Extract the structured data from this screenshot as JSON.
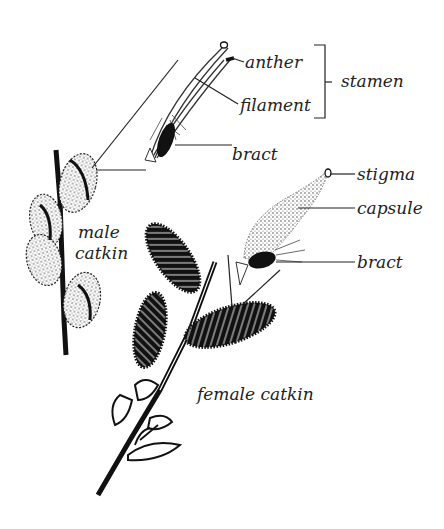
{
  "diagram": {
    "colors": {
      "ink": "#111111",
      "text": "#222222",
      "background": "#ffffff"
    },
    "labels": {
      "anther": "anther",
      "filament": "filament",
      "stamen": "stamen",
      "bract_male": "bract",
      "stigma": "stigma",
      "capsule": "capsule",
      "bract_female": "bract",
      "male_catkin_line1": "male",
      "male_catkin_line2": "catkin",
      "female_catkin": "female catkin"
    }
  }
}
